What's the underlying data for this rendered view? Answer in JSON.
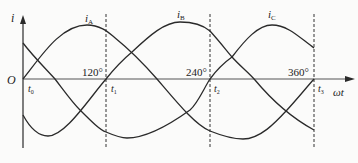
{
  "diagram": {
    "y_axis_label": "i",
    "x_axis_label": "ωt",
    "origin_label": "O",
    "curves": [
      {
        "name": "iA",
        "label_main": "i",
        "label_sub": "A"
      },
      {
        "name": "iB",
        "label_main": "i",
        "label_sub": "B"
      },
      {
        "name": "iC",
        "label_main": "i",
        "label_sub": "C"
      }
    ],
    "markers": [
      {
        "t_main": "t",
        "t_sub": "0",
        "angle": ""
      },
      {
        "t_main": "t",
        "t_sub": "1",
        "angle": "120°"
      },
      {
        "t_main": "t",
        "t_sub": "2",
        "angle": "240°"
      },
      {
        "t_main": "t",
        "t_sub": "3",
        "angle": "360°"
      }
    ],
    "colors": {
      "line": "#2a2a2a",
      "background": "#fbfbfa"
    }
  }
}
